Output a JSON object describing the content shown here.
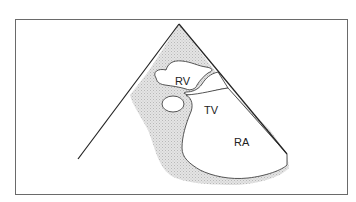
{
  "diagram": {
    "type": "echocardiographic sector view",
    "labels": {
      "rv": "RV",
      "tv": "TV",
      "ra": "RA"
    },
    "colors": {
      "frame": "#6a6a6a",
      "sector_line": "#222222",
      "tissue_fill": "#d9d9d9",
      "outline": "#444444"
    }
  }
}
